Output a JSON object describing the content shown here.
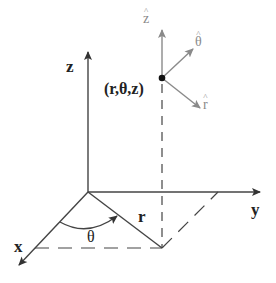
{
  "diagram": {
    "type": "cylindrical-coordinate-system",
    "axes": {
      "x_label": "x",
      "y_label": "y",
      "z_label": "z"
    },
    "point_label": "(r,θ,z)",
    "radial_label": "r",
    "angle_label": "θ",
    "unit_vectors": {
      "z_hat": "z",
      "theta_hat": "θ",
      "r_hat": "r",
      "hat_symbol": "^"
    },
    "colors": {
      "axis": "#333333",
      "unit_vector": "#8a8a8a",
      "point": "#111111",
      "background": "#ffffff"
    }
  }
}
